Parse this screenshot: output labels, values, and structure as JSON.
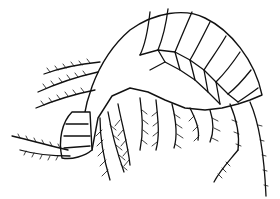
{
  "image": {
    "subject": "amphipod crustacean line drawing",
    "style": "black ink on white",
    "width": 280,
    "height": 199,
    "colors": {
      "ink": "#111111",
      "background": "#ffffff"
    }
  }
}
